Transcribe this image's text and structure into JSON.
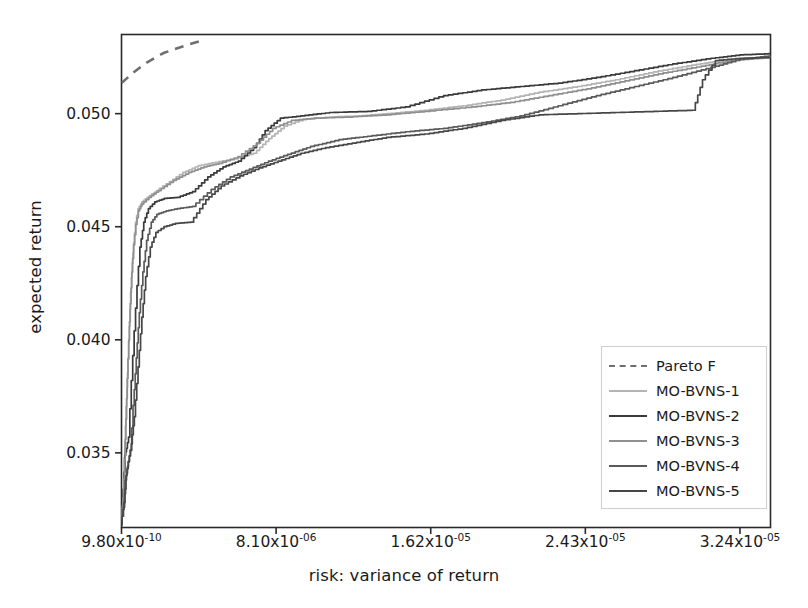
{
  "chart_data": {
    "type": "line",
    "title": "",
    "xlabel": "risk: variance of return",
    "ylabel": "expected return",
    "grid": false,
    "legend_position": "lower right",
    "xtick_labels": [
      "9.80x10-10",
      "8.10x10-06",
      "1.62x10-05",
      "2.43x10-05",
      "3.24x10-05"
    ],
    "xtick_mantissas": [
      "9.80x10",
      "8.10x10",
      "1.62x10",
      "2.43x10",
      "3.24x10"
    ],
    "xtick_exponents": [
      "-10",
      "-06",
      "-05",
      "-05",
      "-05"
    ],
    "xtick_values": [
      9.8e-10,
      8.1e-06,
      1.62e-05,
      2.43e-05,
      3.24e-05
    ],
    "ytick_labels": [
      "0.035",
      "0.040",
      "0.045",
      "0.050"
    ],
    "ytick_values": [
      0.035,
      0.04,
      0.045,
      0.05
    ],
    "xlim": [
      9.8e-10,
      3.4e-05
    ],
    "ylim": [
      0.0317,
      0.0535
    ],
    "series": [
      {
        "name": "Pareto F",
        "style": "dashed",
        "color": "#6f6f6f",
        "points": [
          [
            9.8e-10,
            0.05135
          ],
          [
            6e-07,
            0.0518
          ],
          [
            1.3e-06,
            0.05225
          ],
          [
            2.2e-06,
            0.05268
          ],
          [
            3.3e-06,
            0.053
          ],
          [
            4.1e-06,
            0.0532
          ]
        ]
      },
      {
        "name": "MO-BVNS-1",
        "style": "solid",
        "color": "#b4b4b4",
        "points": [
          [
            9.8e-10,
            0.0322
          ],
          [
            1e-07,
            0.0331
          ],
          [
            1.6e-07,
            0.0348
          ],
          [
            2.2e-07,
            0.0362
          ],
          [
            3e-07,
            0.0379
          ],
          [
            3.6e-07,
            0.0392
          ],
          [
            4.2e-07,
            0.0406
          ],
          [
            5e-07,
            0.0421
          ],
          [
            5.8e-07,
            0.0434
          ],
          [
            6.6e-07,
            0.0443
          ],
          [
            7.6e-07,
            0.0452
          ],
          [
            9e-07,
            0.0458
          ],
          [
            1.1e-06,
            0.0461
          ],
          [
            1.4e-06,
            0.0463
          ],
          [
            1.9e-06,
            0.0466
          ],
          [
            2.6e-06,
            0.047
          ],
          [
            3.3e-06,
            0.0474
          ],
          [
            4.1e-06,
            0.0477
          ],
          [
            5e-06,
            0.04785
          ],
          [
            6e-06,
            0.048
          ],
          [
            7e-06,
            0.04825
          ],
          [
            7.8e-06,
            0.0489
          ],
          [
            8.6e-06,
            0.04945
          ],
          [
            9.6e-06,
            0.04975
          ],
          [
            1.1e-05,
            0.04985
          ],
          [
            1.25e-05,
            0.0499
          ],
          [
            1.4e-05,
            0.05
          ],
          [
            1.6e-05,
            0.05015
          ],
          [
            1.8e-05,
            0.05035
          ],
          [
            2e-05,
            0.0506
          ],
          [
            2.2e-05,
            0.05095
          ],
          [
            2.4e-05,
            0.0512
          ],
          [
            2.6e-05,
            0.0515
          ],
          [
            2.8e-05,
            0.05185
          ],
          [
            3e-05,
            0.05215
          ],
          [
            3.15e-05,
            0.05235
          ],
          [
            3.3e-05,
            0.05245
          ],
          [
            3.4e-05,
            0.0525
          ]
        ]
      },
      {
        "name": "MO-BVNS-2",
        "style": "solid",
        "color": "#3a3a3a",
        "points": [
          [
            9.8e-10,
            0.032
          ],
          [
            1.2e-07,
            0.0334
          ],
          [
            2e-07,
            0.0349
          ],
          [
            2.8e-07,
            0.0352
          ],
          [
            4e-07,
            0.0357
          ],
          [
            5.5e-07,
            0.0382
          ],
          [
            7e-07,
            0.0404
          ],
          [
            8.5e-07,
            0.0424
          ],
          [
            1e-06,
            0.0441
          ],
          [
            1.2e-06,
            0.0452
          ],
          [
            1.45e-06,
            0.0458
          ],
          [
            1.8e-06,
            0.0461
          ],
          [
            2.3e-06,
            0.04625
          ],
          [
            3e-06,
            0.0463
          ],
          [
            3.8e-06,
            0.04655
          ],
          [
            4.6e-06,
            0.0472
          ],
          [
            5.4e-06,
            0.04765
          ],
          [
            6.2e-06,
            0.0479
          ],
          [
            7e-06,
            0.0485
          ],
          [
            7.6e-06,
            0.04925
          ],
          [
            8.4e-06,
            0.0498
          ],
          [
            9.5e-06,
            0.0499
          ],
          [
            1.1e-05,
            0.05005
          ],
          [
            1.3e-05,
            0.0501
          ],
          [
            1.5e-05,
            0.0503
          ],
          [
            1.7e-05,
            0.0508
          ],
          [
            1.9e-05,
            0.05105
          ],
          [
            2.1e-05,
            0.0512
          ],
          [
            2.3e-05,
            0.05135
          ],
          [
            2.5e-05,
            0.0516
          ],
          [
            2.7e-05,
            0.0519
          ],
          [
            2.9e-05,
            0.0522
          ],
          [
            3.1e-05,
            0.05245
          ],
          [
            3.25e-05,
            0.0526
          ],
          [
            3.4e-05,
            0.05265
          ]
        ]
      },
      {
        "name": "MO-BVNS-3",
        "style": "solid",
        "color": "#8f8f8f",
        "points": [
          [
            9.8e-10,
            0.0321
          ],
          [
            1e-07,
            0.033
          ],
          [
            1.8e-07,
            0.0347
          ],
          [
            2.5e-07,
            0.0365
          ],
          [
            3.2e-07,
            0.0383
          ],
          [
            4e-07,
            0.04
          ],
          [
            4.8e-07,
            0.0416
          ],
          [
            5.6e-07,
            0.043
          ],
          [
            6.6e-07,
            0.0442
          ],
          [
            7.8e-07,
            0.0451
          ],
          [
            9.2e-07,
            0.0457
          ],
          [
            1.1e-06,
            0.046
          ],
          [
            1.5e-06,
            0.0463
          ],
          [
            2e-06,
            0.0466
          ],
          [
            2.8e-06,
            0.04705
          ],
          [
            3.6e-06,
            0.0474
          ],
          [
            4.4e-06,
            0.04765
          ],
          [
            5.2e-06,
            0.0478
          ],
          [
            6.2e-06,
            0.0481
          ],
          [
            7.2e-06,
            0.0487
          ],
          [
            8e-06,
            0.04935
          ],
          [
            9e-06,
            0.0497
          ],
          [
            1.02e-05,
            0.0498
          ],
          [
            1.2e-05,
            0.04985
          ],
          [
            1.4e-05,
            0.04995
          ],
          [
            1.6e-05,
            0.0501
          ],
          [
            1.85e-05,
            0.0503
          ],
          [
            2.05e-05,
            0.0505
          ],
          [
            2.25e-05,
            0.0508
          ],
          [
            2.45e-05,
            0.0511
          ],
          [
            2.65e-05,
            0.05145
          ],
          [
            2.85e-05,
            0.0518
          ],
          [
            3.05e-05,
            0.0521
          ],
          [
            3.2e-05,
            0.05235
          ],
          [
            3.4e-05,
            0.05248
          ]
        ]
      },
      {
        "name": "MO-BVNS-4",
        "style": "solid",
        "color": "#5a5a5a",
        "points": [
          [
            9.8e-10,
            0.0318
          ],
          [
            1.4e-07,
            0.0326
          ],
          [
            2.4e-07,
            0.0338
          ],
          [
            3.4e-07,
            0.0344
          ],
          [
            5e-07,
            0.0351
          ],
          [
            6.4e-07,
            0.0371
          ],
          [
            8e-07,
            0.0392
          ],
          [
            9.6e-07,
            0.0412
          ],
          [
            1.15e-06,
            0.043
          ],
          [
            1.35e-06,
            0.0444
          ],
          [
            1.6e-06,
            0.0452
          ],
          [
            1.9e-06,
            0.04555
          ],
          [
            2.4e-06,
            0.0457
          ],
          [
            3e-06,
            0.0458
          ],
          [
            3.8e-06,
            0.0459
          ],
          [
            4.8e-06,
            0.04665
          ],
          [
            5.8e-06,
            0.0472
          ],
          [
            6.8e-06,
            0.04755
          ],
          [
            7.8e-06,
            0.0479
          ],
          [
            8.8e-06,
            0.0482
          ],
          [
            1e-05,
            0.04855
          ],
          [
            1.15e-05,
            0.04885
          ],
          [
            1.3e-05,
            0.049
          ],
          [
            1.5e-05,
            0.0492
          ],
          [
            1.7e-05,
            0.04935
          ],
          [
            1.9e-05,
            0.0496
          ],
          [
            2.1e-05,
            0.0499
          ],
          [
            2.3e-05,
            0.05035
          ],
          [
            2.5e-05,
            0.0508
          ],
          [
            2.7e-05,
            0.0512
          ],
          [
            2.9e-05,
            0.0516
          ],
          [
            3.1e-05,
            0.05205
          ],
          [
            3.25e-05,
            0.0524
          ],
          [
            3.4e-05,
            0.05255
          ]
        ]
      },
      {
        "name": "MO-BVNS-5",
        "style": "solid",
        "color": "#474747",
        "points": [
          [
            9.8e-10,
            0.0319
          ],
          [
            1.6e-07,
            0.0328
          ],
          [
            2.6e-07,
            0.034
          ],
          [
            3.8e-07,
            0.0346
          ],
          [
            5.4e-07,
            0.0354
          ],
          [
            7e-07,
            0.0366
          ],
          [
            9e-07,
            0.0388
          ],
          [
            1.1e-06,
            0.041
          ],
          [
            1.3e-06,
            0.0428
          ],
          [
            1.55e-06,
            0.0441
          ],
          [
            1.85e-06,
            0.04475
          ],
          [
            2.3e-06,
            0.045
          ],
          [
            2.9e-06,
            0.04515
          ],
          [
            3.7e-06,
            0.0452
          ],
          [
            4.5e-06,
            0.0462
          ],
          [
            5.3e-06,
            0.0468
          ],
          [
            6.3e-06,
            0.04725
          ],
          [
            7.3e-06,
            0.0476
          ],
          [
            8.3e-06,
            0.0479
          ],
          [
            9.5e-06,
            0.04825
          ],
          [
            1.08e-05,
            0.0485
          ],
          [
            1.22e-05,
            0.0487
          ],
          [
            1.4e-05,
            0.04895
          ],
          [
            1.6e-05,
            0.0491
          ],
          [
            1.8e-05,
            0.04935
          ],
          [
            2e-05,
            0.0497
          ],
          [
            2.2e-05,
            0.04995
          ],
          [
            2.4e-05,
            0.05
          ],
          [
            2.6e-05,
            0.05005
          ],
          [
            2.8e-05,
            0.0501
          ],
          [
            3e-05,
            0.05015
          ],
          [
            3.05e-05,
            0.0515
          ],
          [
            3.12e-05,
            0.05235
          ],
          [
            3.25e-05,
            0.05245
          ],
          [
            3.4e-05,
            0.05248
          ]
        ]
      }
    ]
  },
  "axes": {
    "frame_color": "#2a2a2a",
    "background": "#ffffff"
  }
}
